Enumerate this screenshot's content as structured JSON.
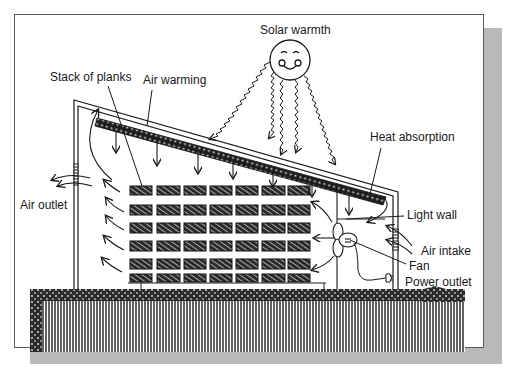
{
  "diagram": {
    "labels": {
      "solar_warmth": "Solar warmth",
      "stack_of_planks": "Stack of planks",
      "air_warming": "Air warming",
      "heat_absorption": "Heat absorption",
      "air_outlet": "Air outlet",
      "light_wall": "Light wall",
      "air_intake": "Air intake",
      "fan": "Fan",
      "power_outlet": "Power outlet"
    },
    "plank_stack": {
      "columns": 7,
      "rows": 6
    },
    "colors": {
      "ink": "#1a1a1a",
      "frame_border": "#5a5a5a",
      "shadow": "#b9b9b9",
      "background": "#ffffff"
    }
  }
}
